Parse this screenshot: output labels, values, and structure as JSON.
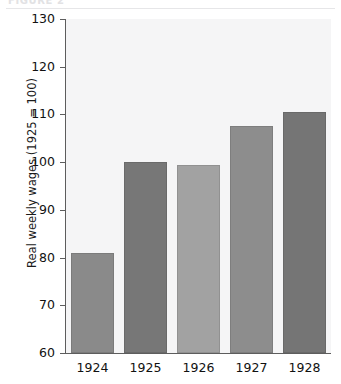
{
  "header": {
    "caption": "FIGURE 2",
    "rule_color": "#e6e6e8"
  },
  "chart_data": {
    "type": "bar",
    "title": "",
    "xlabel": "",
    "ylabel": "Real weekly wages (1925 = 100)",
    "categories": [
      "1924",
      "1925",
      "1926",
      "1927",
      "1928"
    ],
    "values": [
      81,
      100,
      99.5,
      107.5,
      110.5
    ],
    "ylim": [
      60,
      130
    ],
    "yticks": [
      60,
      70,
      80,
      90,
      100,
      110,
      120,
      130
    ],
    "ytick_labels": [
      "60",
      "70",
      "80",
      "90",
      "100",
      "110",
      "120",
      "130"
    ],
    "grid": false,
    "legend": "none",
    "bar_colors": [
      "#8a8a8a",
      "#777777",
      "#a2a2a2",
      "#8d8d8d",
      "#757575"
    ],
    "plot_background": "#f5f5f6",
    "axis_color": "#5d5d5d"
  }
}
